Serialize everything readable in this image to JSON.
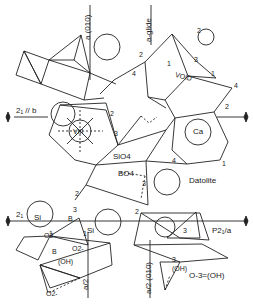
{
  "diagram": {
    "title": "Datolite",
    "space_group": "P2₁/a",
    "labels": {
      "a_010_top": "a (010)",
      "a_glide": "a-glide",
      "screw_b": "2₁ // b",
      "screw_left": "2₁",
      "void": "VOID",
      "ca": "Ca",
      "viii": "VIII",
      "sio4": "SiO4",
      "bo4": "BO4",
      "datolite": "Datolite",
      "p21a": "P2₁/a",
      "si_left": "Si",
      "si_right": "Si",
      "b_left": "B",
      "b_lower": "B",
      "o2_a": "O2-",
      "o2_b": "O2-",
      "o2_c": "O2-",
      "oh_a": "(OH)",
      "oh_b": "(OH)",
      "o3_oh": "O-3=(OH)",
      "a2": "a/2",
      "a2_010": "a/2 (010)"
    },
    "vertex_numbers": {
      "n1": "1",
      "n2": "2",
      "n3": "3",
      "n4": "4"
    }
  }
}
